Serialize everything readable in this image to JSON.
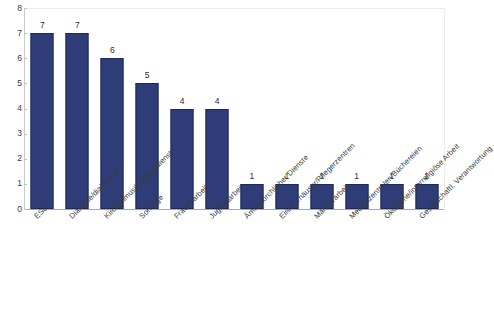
{
  "chart_data": {
    "type": "bar",
    "title": "",
    "subtitle": "",
    "xlabel": "",
    "ylabel": "",
    "ylim": [
      0,
      8
    ],
    "yticks": [
      0,
      1,
      2,
      3,
      4,
      5,
      6,
      7,
      8
    ],
    "grid": false,
    "legend": false,
    "legend_position": "none",
    "bar_color": "#2E3D77",
    "bar_edge_color": "#1D2A55",
    "axis_color": "#A8A8B0",
    "label_rotation": -45,
    "categories": [
      "ESG",
      "Diakonie/diakonisch",
      "Kirchenmusik/Gottesdienst",
      "Sonstige",
      "Frauenarbeit",
      "Jugendarbeit",
      "Ämter kirchlicher Dienste",
      "Einkehrhäuser/Pflegerzentren",
      "Männerarbeit",
      "Medienzentralen/Büchereien",
      "Ökumene/interreligiöse Arbeit",
      "Gesellschaftl. Verantwortung"
    ],
    "values": [
      7,
      7,
      6,
      5,
      4,
      4,
      1,
      1,
      1,
      1,
      1,
      1
    ],
    "data_labels": [
      "7",
      "7",
      "6",
      "5",
      "4",
      "4",
      "1",
      "1",
      "1",
      "1",
      "1",
      "1"
    ],
    "ytick_labels": [
      "0",
      "1",
      "2",
      "3",
      "4",
      "5",
      "6",
      "7",
      "8"
    ]
  }
}
